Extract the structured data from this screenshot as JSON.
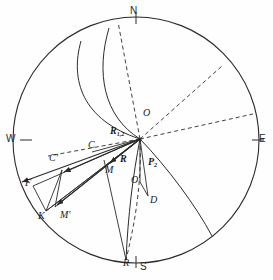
{
  "figure": {
    "type": "stereographic-projection-diagram",
    "background_color": "#fefefe",
    "stroke_color": "#2b2b2b",
    "primitive_circle": {
      "cx": 136,
      "cy": 140,
      "r": 123
    },
    "compass": [
      {
        "name": "north",
        "label": "N",
        "x": 132,
        "y": 12
      },
      {
        "name": "south",
        "label": "S",
        "x": 142,
        "y": 265
      },
      {
        "name": "east",
        "label": "E",
        "x": 258,
        "y": 135
      },
      {
        "name": "west",
        "label": "W",
        "x": 8,
        "y": 135
      }
    ],
    "points": [
      {
        "name": "origin-upper",
        "label": "O",
        "x": 141,
        "y": 114
      },
      {
        "name": "point-c",
        "label": "C",
        "x": 92,
        "y": 144
      },
      {
        "name": "point-c-prime",
        "label": "C'",
        "x": 52,
        "y": 157
      },
      {
        "name": "point-f",
        "label": "F",
        "x": 28,
        "y": 182
      },
      {
        "name": "point-k",
        "label": "K",
        "x": 42,
        "y": 216
      },
      {
        "name": "point-m-prime",
        "label": "M'",
        "x": 63,
        "y": 214
      },
      {
        "name": "point-m",
        "label": "M",
        "x": 108,
        "y": 169
      },
      {
        "name": "point-o-lower",
        "label": "O",
        "x": 133,
        "y": 179
      },
      {
        "name": "point-d",
        "label": "D",
        "x": 152,
        "y": 199
      },
      {
        "name": "point-r-bottom",
        "label": "R",
        "x": 126,
        "y": 262
      }
    ],
    "vectors": [
      {
        "name": "vector-r12",
        "label": "R",
        "sub": "1,2",
        "x": 113,
        "y": 130
      },
      {
        "name": "vector-r",
        "label": "R",
        "sub": "",
        "x": 121,
        "y": 158
      },
      {
        "name": "vector-p2",
        "label": "P",
        "sub": "2",
        "x": 150,
        "y": 161
      }
    ]
  }
}
